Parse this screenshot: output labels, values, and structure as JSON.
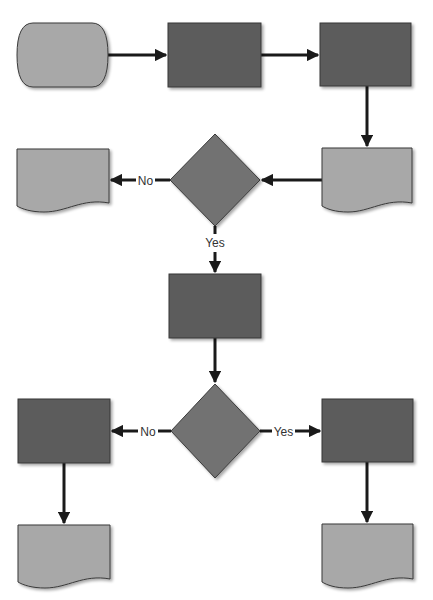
{
  "diagram": {
    "type": "flowchart",
    "colors": {
      "background": "#ffffff",
      "process_fill": "#5b5b5b",
      "decision_fill": "#727272",
      "document_fill": "#a8a8a8",
      "terminal_fill": "#a8a8a8",
      "stroke": "#3a3a3a",
      "arrow": "#1a1a1a",
      "label_text": "#333333"
    },
    "nodes": [
      {
        "id": "start",
        "shape": "terminal",
        "x": 17,
        "y": 23,
        "w": 91,
        "h": 64
      },
      {
        "id": "process-1",
        "shape": "process",
        "x": 168,
        "y": 23,
        "w": 93,
        "h": 64
      },
      {
        "id": "process-2",
        "shape": "process",
        "x": 320,
        "y": 23,
        "w": 91,
        "h": 63
      },
      {
        "id": "document-right",
        "shape": "document",
        "x": 322,
        "y": 148,
        "w": 90,
        "h": 62
      },
      {
        "id": "decision-1",
        "shape": "decision",
        "cx": 215,
        "cy": 180,
        "w": 90,
        "h": 92
      },
      {
        "id": "document-left",
        "shape": "document",
        "x": 17,
        "y": 149,
        "w": 92,
        "h": 61
      },
      {
        "id": "process-3",
        "shape": "process",
        "x": 169,
        "y": 274,
        "w": 92,
        "h": 64
      },
      {
        "id": "decision-2",
        "shape": "decision",
        "cx": 215,
        "cy": 431,
        "w": 89,
        "h": 94
      },
      {
        "id": "process-4",
        "shape": "process",
        "x": 18,
        "y": 399,
        "w": 92,
        "h": 64
      },
      {
        "id": "process-5",
        "shape": "process",
        "x": 322,
        "y": 399,
        "w": 91,
        "h": 63
      },
      {
        "id": "document-bottom-left",
        "shape": "document",
        "x": 18,
        "y": 525,
        "w": 92,
        "h": 61
      },
      {
        "id": "document-bottom-right",
        "shape": "document",
        "x": 322,
        "y": 524,
        "w": 91,
        "h": 62
      }
    ],
    "edges": [
      {
        "from": "start",
        "to": "process-1",
        "label": ""
      },
      {
        "from": "process-1",
        "to": "process-2",
        "label": ""
      },
      {
        "from": "process-2",
        "to": "document-right",
        "label": ""
      },
      {
        "from": "document-right",
        "to": "decision-1",
        "label": ""
      },
      {
        "from": "decision-1",
        "to": "document-left",
        "label": "No"
      },
      {
        "from": "decision-1",
        "to": "process-3",
        "label": "Yes"
      },
      {
        "from": "process-3",
        "to": "decision-2",
        "label": ""
      },
      {
        "from": "decision-2",
        "to": "process-4",
        "label": "No"
      },
      {
        "from": "decision-2",
        "to": "process-5",
        "label": "Yes"
      },
      {
        "from": "process-4",
        "to": "document-bottom-left",
        "label": ""
      },
      {
        "from": "process-5",
        "to": "document-bottom-right",
        "label": ""
      }
    ],
    "labels": {
      "decision1_no": "No",
      "decision1_yes": "Yes",
      "decision2_no": "No",
      "decision2_yes": "Yes"
    }
  }
}
